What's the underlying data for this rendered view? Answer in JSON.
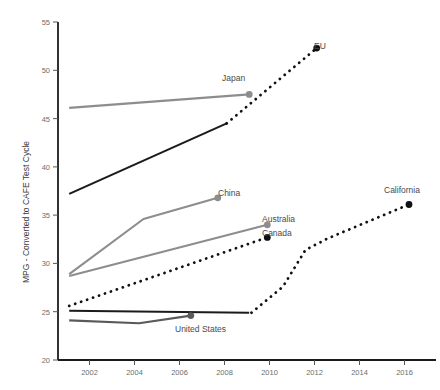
{
  "chart_data": {
    "type": "line",
    "title": "",
    "xlabel": "",
    "ylabel": "MPG - Converted to CAFE Test Cycle",
    "xlim": [
      2000.6,
      2017.4
    ],
    "ylim": [
      20,
      55
    ],
    "xticks": [
      2002,
      2004,
      2006,
      2008,
      2010,
      2012,
      2014,
      2016
    ],
    "yticks": [
      20,
      25,
      30,
      35,
      40,
      45,
      50,
      55
    ],
    "xtick_labels": [
      "2002",
      "2004",
      "2006",
      "2008",
      "2010",
      "2012",
      "2014",
      "2016"
    ],
    "ytick_labels": [
      "20",
      "25",
      "30",
      "35",
      "40",
      "45",
      "50",
      "55"
    ],
    "grid": false,
    "legend": "inline-endpoint-labels",
    "colors": {
      "historical_dark": "#1b1b1b",
      "historical_gray": "#8d8d8d",
      "historical_mid_gray": "#6f6f6f",
      "projection_dotted": "#111111",
      "axis": "#1b1b1b",
      "tick_text": "#6d6d6d",
      "label_text": "#4a4a4a"
    },
    "series": [
      {
        "name": "EU",
        "label": "EU",
        "style": "solid",
        "color": "#1b1b1b",
        "marker_end": false,
        "points": [
          {
            "x": 2001.1,
            "y": 37.2
          },
          {
            "x": 2008.1,
            "y": 44.5
          }
        ]
      },
      {
        "name": "EU projection",
        "label": "EU",
        "style": "dotted",
        "color": "#111111",
        "marker_end": true,
        "marker_value": 52.3,
        "points": [
          {
            "x": 2008.1,
            "y": 44.5
          },
          {
            "x": 2012.1,
            "y": 52.3
          }
        ]
      },
      {
        "name": "Japan",
        "label": "Japan",
        "style": "solid",
        "color": "#8d8d8d",
        "marker_end": true,
        "marker_value": 47.5,
        "points": [
          {
            "x": 2001.1,
            "y": 46.1
          },
          {
            "x": 2009.1,
            "y": 47.5
          }
        ]
      },
      {
        "name": "China",
        "label": "China",
        "style": "solid",
        "color": "#8d8d8d",
        "marker_end": true,
        "marker_value": 36.8,
        "points": [
          {
            "x": 2001.1,
            "y": 28.9
          },
          {
            "x": 2004.4,
            "y": 34.6
          },
          {
            "x": 2007.7,
            "y": 36.8
          }
        ]
      },
      {
        "name": "Australia",
        "label": "Australia",
        "style": "solid",
        "color": "#8d8d8d",
        "marker_end": true,
        "marker_value": 34.0,
        "points": [
          {
            "x": 2001.1,
            "y": 28.7
          },
          {
            "x": 2009.9,
            "y": 34.0
          }
        ]
      },
      {
        "name": "Canada",
        "label": "Canada",
        "style": "dotted",
        "color": "#111111",
        "marker_end": true,
        "marker_value": 32.7,
        "points": [
          {
            "x": 2001.1,
            "y": 25.6
          },
          {
            "x": 2009.9,
            "y": 32.7
          }
        ]
      },
      {
        "name": "United States standard",
        "label": "",
        "style": "solid",
        "color": "#1b1b1b",
        "marker_end": false,
        "points": [
          {
            "x": 2001.1,
            "y": 25.1
          },
          {
            "x": 2009.1,
            "y": 24.9
          }
        ]
      },
      {
        "name": "United States",
        "label": "United States",
        "style": "solid",
        "color": "#5a5a5a",
        "marker_end": true,
        "marker_value": 24.6,
        "points": [
          {
            "x": 2001.1,
            "y": 24.1
          },
          {
            "x": 2004.2,
            "y": 23.8
          },
          {
            "x": 2006.5,
            "y": 24.6
          }
        ]
      },
      {
        "name": "California projection",
        "label": "California",
        "style": "dotted",
        "color": "#111111",
        "marker_end": true,
        "marker_value": 36.1,
        "points": [
          {
            "x": 2009.2,
            "y": 24.9
          },
          {
            "x": 2010.6,
            "y": 27.6
          },
          {
            "x": 2011.6,
            "y": 31.4
          },
          {
            "x": 2012.6,
            "y": 32.6
          },
          {
            "x": 2016.2,
            "y": 36.1
          }
        ]
      }
    ],
    "series_labels": [
      {
        "name": "EU",
        "text": "EU",
        "x_px": 314,
        "y_px": 49
      },
      {
        "name": "Japan",
        "text": "Japan",
        "x_px": 222,
        "y_px": 81
      },
      {
        "name": "China",
        "text": "China",
        "x_px": 218,
        "y_px": 196
      },
      {
        "name": "Australia",
        "text": "Australia",
        "x_px": 262,
        "y_px": 222
      },
      {
        "name": "Canada",
        "text": "Canada",
        "x_px": 262,
        "y_px": 236
      },
      {
        "name": "California",
        "text": "California",
        "x_px": 384,
        "y_px": 193
      },
      {
        "name": "United States",
        "text": "United States",
        "x_px": 175,
        "y_px": 332
      }
    ]
  }
}
